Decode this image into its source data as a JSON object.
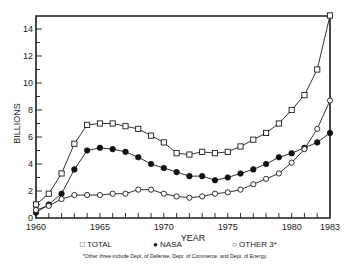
{
  "chart_data": {
    "type": "line",
    "title": "",
    "xlabel": "YEAR",
    "ylabel": "BILLIONS",
    "x": [
      1960,
      1961,
      1962,
      1963,
      1964,
      1965,
      1966,
      1967,
      1968,
      1969,
      1970,
      1971,
      1972,
      1973,
      1974,
      1975,
      1976,
      1977,
      1978,
      1979,
      1980,
      1981,
      1982,
      1983
    ],
    "xticks": [
      "1960",
      "1965",
      "1970",
      "1975",
      "1980",
      "1983"
    ],
    "yticks": [
      "0",
      "2",
      "4",
      "6",
      "8",
      "10",
      "12",
      "14"
    ],
    "ylim": [
      0,
      15
    ],
    "xlim": [
      1960,
      1983
    ],
    "grid": false,
    "legend_position": "bottom",
    "series": [
      {
        "name": "TOTAL",
        "marker": "open-square",
        "values": [
          1.0,
          1.8,
          3.3,
          5.5,
          6.9,
          7.0,
          7.0,
          6.8,
          6.6,
          6.1,
          5.6,
          4.8,
          4.7,
          4.9,
          4.8,
          4.9,
          5.3,
          5.8,
          6.3,
          7.0,
          8.0,
          9.1,
          11.0,
          15.0
        ]
      },
      {
        "name": "NASA",
        "marker": "filled-circle",
        "values": [
          0.4,
          1.0,
          1.8,
          3.6,
          5.0,
          5.2,
          5.1,
          4.9,
          4.5,
          4.0,
          3.7,
          3.4,
          3.1,
          3.1,
          2.8,
          3.0,
          3.3,
          3.6,
          4.0,
          4.5,
          4.8,
          5.2,
          5.6,
          6.3
        ]
      },
      {
        "name": "OTHER 3*",
        "marker": "open-circle",
        "values": [
          0.6,
          0.9,
          1.4,
          1.7,
          1.7,
          1.7,
          1.8,
          1.8,
          2.1,
          2.1,
          1.8,
          1.6,
          1.5,
          1.6,
          1.8,
          1.9,
          2.1,
          2.5,
          2.9,
          3.3,
          4.1,
          5.1,
          6.6,
          8.7
        ]
      }
    ],
    "annotations": [
      "*Other three include Dept. of Defense, Dept. of Commerce, and Dept. of Energy."
    ]
  },
  "legend": {
    "total": "TOTAL",
    "nasa": "NASA",
    "other": "OTHER 3*"
  },
  "footnote": "*Other three include Dept. of Defense, Dept. of Commerce, and Dept. of Energy."
}
